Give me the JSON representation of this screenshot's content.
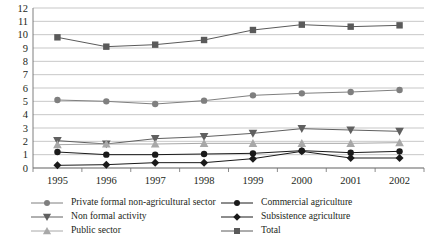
{
  "chart_data": {
    "type": "line",
    "title": "",
    "subtitle": "",
    "xlabel": "",
    "ylabel": "",
    "categories": [
      "1995",
      "1996",
      "1997",
      "1998",
      "1999",
      "2000",
      "2001",
      "2002"
    ],
    "x": [
      1995,
      1996,
      1997,
      1998,
      1999,
      2000,
      2001,
      2002
    ],
    "ylim": [
      0,
      12
    ],
    "ytick_step": 1,
    "ytick_labels": [
      "0",
      "1",
      "2",
      "3",
      "4",
      "5",
      "6",
      "7",
      "8",
      "9",
      "10",
      "11",
      "12"
    ],
    "grid": "horizontal",
    "legend_position": "bottom",
    "legend_columns": 2,
    "series": [
      {
        "name": "Private formal non-agricultural sector",
        "marker": "circle",
        "color": "#7f7f7f",
        "values": [
          5.1,
          5.0,
          4.8,
          5.05,
          5.45,
          5.6,
          5.7,
          5.85
        ]
      },
      {
        "name": "Non formal activity",
        "marker": "triangle-down",
        "color": "#606060",
        "values": [
          2.05,
          1.8,
          2.2,
          2.35,
          2.6,
          2.95,
          2.85,
          2.75
        ]
      },
      {
        "name": "Public sector",
        "marker": "triangle-up",
        "color": "#a8a8a8",
        "values": [
          1.75,
          1.8,
          1.8,
          1.85,
          1.85,
          1.85,
          1.85,
          1.9
        ]
      },
      {
        "name": "Commercial agriculture",
        "marker": "circle",
        "color": "#1a1a1a",
        "values": [
          1.2,
          1.0,
          1.0,
          1.05,
          1.1,
          1.3,
          1.15,
          1.25
        ]
      },
      {
        "name": "Subsistence agriculture",
        "marker": "diamond",
        "color": "#1a1a1a",
        "values": [
          0.2,
          0.25,
          0.4,
          0.4,
          0.7,
          1.25,
          0.75,
          0.75
        ]
      },
      {
        "name": "Total",
        "marker": "square",
        "color": "#5a5a5a",
        "values": [
          9.8,
          9.1,
          9.25,
          9.6,
          10.35,
          10.75,
          10.6,
          10.7
        ]
      }
    ]
  },
  "legend": {
    "items": [
      {
        "label": "Private formal non-agricultural sector"
      },
      {
        "label": "Non formal activity"
      },
      {
        "label": "Public sector"
      },
      {
        "label": "Commercial agriculture"
      },
      {
        "label": "Subsistence agriculture"
      },
      {
        "label": "Total"
      }
    ]
  }
}
